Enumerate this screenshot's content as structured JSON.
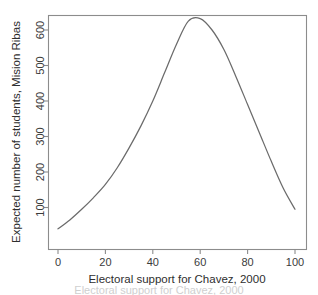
{
  "chart_data": {
    "type": "line",
    "title": "",
    "xlabel": "Electoral support for Chavez, 2000",
    "ylabel": "Expected number of students, Mision Ribas",
    "xlim": [
      -2,
      104
    ],
    "ylim": [
      30,
      650
    ],
    "xticks": [
      0,
      20,
      40,
      60,
      80,
      100
    ],
    "xticklabels": [
      "0",
      "20",
      "40",
      "60",
      "80",
      "100"
    ],
    "yticks": [
      100,
      200,
      300,
      400,
      500,
      600
    ],
    "yticklabels": [
      "100",
      "200",
      "300",
      "400",
      "500",
      "600"
    ],
    "grid": false,
    "legend": null,
    "series": [
      {
        "name": "Expected students",
        "color": "#6b6b6b",
        "x": [
          0,
          5,
          10,
          15,
          20,
          25,
          30,
          35,
          40,
          45,
          50,
          55,
          60,
          65,
          70,
          75,
          80,
          85,
          90,
          95,
          100
        ],
        "y": [
          40,
          65,
          95,
          128,
          165,
          212,
          268,
          330,
          400,
          480,
          560,
          625,
          632,
          600,
          545,
          470,
          390,
          310,
          230,
          155,
          95
        ]
      }
    ],
    "annotations": [],
    "peak": {
      "x": 55,
      "y": 632
    }
  },
  "axes": {
    "x_axis_title": "Electoral support for Chavez, 2000",
    "y_axis_title": "Expected number of students, Mision Ribas",
    "x_tick_labels": [
      "0",
      "20",
      "40",
      "60",
      "80",
      "100"
    ],
    "y_tick_labels": [
      "100",
      "200",
      "300",
      "400",
      "500",
      "600"
    ]
  },
  "colors": {
    "curve": "#6b6b6b",
    "frame": "#8c8c8c",
    "text": "#2e2e2e",
    "background": "#ffffff"
  },
  "caption": {
    "clipped_text": "Electoral support for Chavez, 2000"
  }
}
